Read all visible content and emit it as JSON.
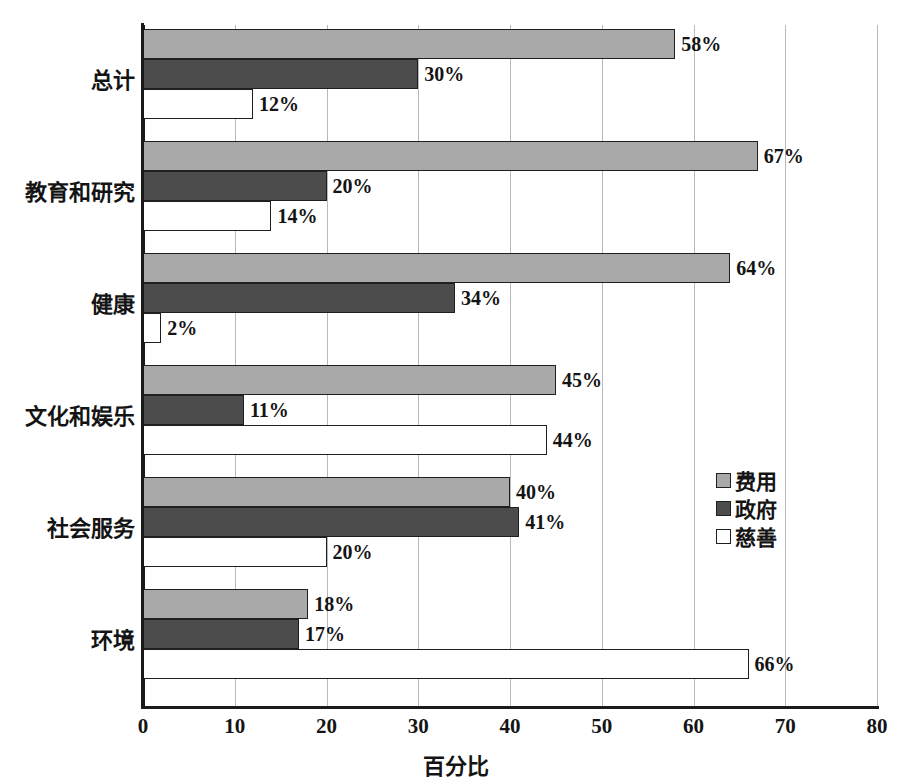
{
  "chart_data": {
    "type": "bar",
    "orientation": "horizontal",
    "title": "",
    "xlabel": "百分比",
    "ylabel": "",
    "xlim": [
      0,
      80
    ],
    "xticks": [
      0,
      10,
      20,
      30,
      40,
      50,
      60,
      70,
      80
    ],
    "xtick_labels": [
      "0",
      "10",
      "20",
      "30",
      "40",
      "50",
      "60",
      "70",
      "80"
    ],
    "grid": true,
    "legend_position": "right-middle",
    "categories": [
      "总计",
      "教育和研究",
      "健康",
      "文化和娱乐",
      "社会服务",
      "环境"
    ],
    "series": [
      {
        "name": "费用",
        "color": "#a9a9a9",
        "values": [
          58,
          67,
          64,
          45,
          40,
          18
        ],
        "labels": [
          "58%",
          "67%",
          "64%",
          "45%",
          "40%",
          "18%"
        ]
      },
      {
        "name": "政府",
        "color": "#4c4c4c",
        "values": [
          30,
          20,
          34,
          11,
          41,
          17
        ],
        "labels": [
          "30%",
          "20%",
          "34%",
          "11%",
          "41%",
          "17%"
        ]
      },
      {
        "name": "慈善",
        "color": "#ffffff",
        "values": [
          12,
          14,
          2,
          44,
          20,
          66
        ],
        "labels": [
          "12%",
          "14%",
          "2%",
          "44%",
          "20%",
          "66%"
        ]
      }
    ]
  },
  "legend": {
    "items": [
      {
        "label": "费用",
        "color": "#a9a9a9"
      },
      {
        "label": "政府",
        "color": "#4c4c4c"
      },
      {
        "label": "慈善",
        "color": "#ffffff"
      }
    ]
  },
  "axis": {
    "x_title": "百分比"
  }
}
